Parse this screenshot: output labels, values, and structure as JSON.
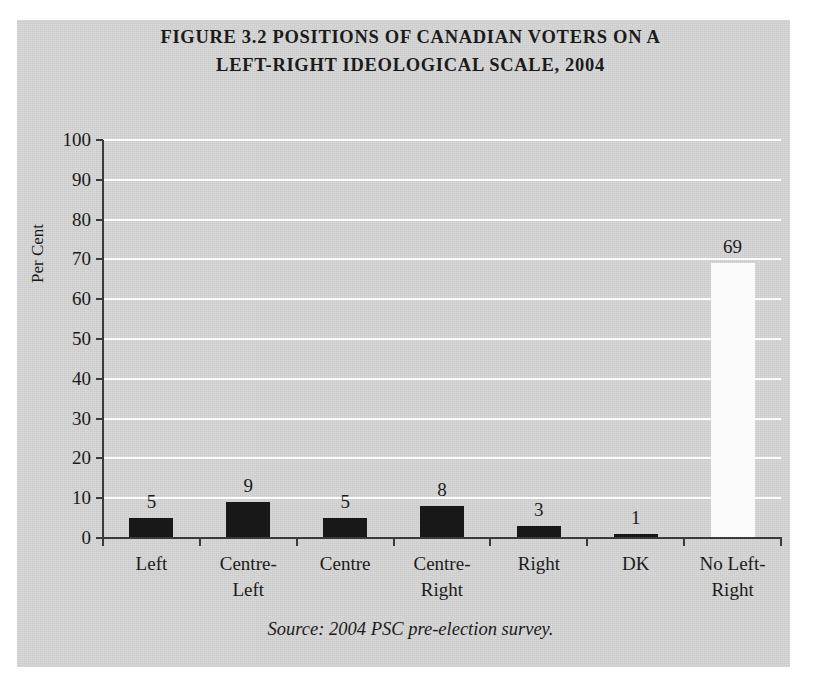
{
  "figure": {
    "title_lines": [
      "FIGURE 3.2 POSITIONS OF CANADIAN VOTERS ON A",
      "LEFT-RIGHT IDEOLOGICAL SCALE, 2004"
    ],
    "source": "Source: 2004 PSC pre-election survey.",
    "panel_background": "#d6d6d6",
    "gridline_color": "#fdfdfd",
    "axis_color": "#3a3a3a"
  },
  "chart_data": {
    "type": "bar",
    "title": "FIGURE 3.2 POSITIONS OF CANADIAN VOTERS ON A LEFT-RIGHT IDEOLOGICAL SCALE, 2004",
    "xlabel": "",
    "ylabel": "Per Cent",
    "ylim": [
      0,
      100
    ],
    "yticks": [
      0,
      10,
      20,
      30,
      40,
      50,
      60,
      70,
      80,
      90,
      100
    ],
    "ytick_labels": [
      "0",
      "10",
      "20",
      "30",
      "40",
      "50",
      "60",
      "70",
      "80",
      "90",
      "100"
    ],
    "grid": true,
    "legend": false,
    "categories": [
      "Left",
      "Centre-Left",
      "Centre",
      "Centre-Right",
      "Right",
      "DK",
      "No Left-Right"
    ],
    "category_label_lines": [
      [
        "Left"
      ],
      [
        "Centre-",
        "Left"
      ],
      [
        "Centre"
      ],
      [
        "Centre-",
        "Right"
      ],
      [
        "Right"
      ],
      [
        "DK"
      ],
      [
        "No Left-",
        "Right"
      ]
    ],
    "values": [
      5,
      9,
      5,
      8,
      3,
      1,
      69
    ],
    "value_labels": [
      "5",
      "9",
      "5",
      "8",
      "3",
      "1",
      "69"
    ],
    "bar_colors": [
      "#181818",
      "#181818",
      "#181818",
      "#181818",
      "#181818",
      "#181818",
      "#fbfbfb"
    ],
    "source": "Source: 2004 PSC pre-election survey."
  }
}
